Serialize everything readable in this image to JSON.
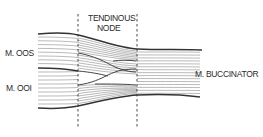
{
  "diagram": {
    "labels": {
      "tendinous_node_line1": "TENDINOUS",
      "tendinous_node_line2": "NODE",
      "m_oos": "M. OOS",
      "m_ooi": "M. OOI",
      "m_buccinator": "M. BUCCINATOR"
    },
    "regions": [
      "M. OOS",
      "M. OOI",
      "Tendinous node",
      "M. Buccinator"
    ]
  }
}
